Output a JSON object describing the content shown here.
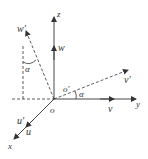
{
  "diagram": {
    "colors": {
      "stroke": "#333333",
      "background": "#ffffff"
    },
    "labels": {
      "z": "z",
      "y": "y",
      "x": "x",
      "w": "w",
      "w_prime": "w′",
      "v": "v",
      "v_prime": "v′",
      "u": "u",
      "u_prime": "u′",
      "o": "o",
      "o_prime": "o′",
      "alpha_top": "α",
      "alpha_right": "α"
    }
  }
}
